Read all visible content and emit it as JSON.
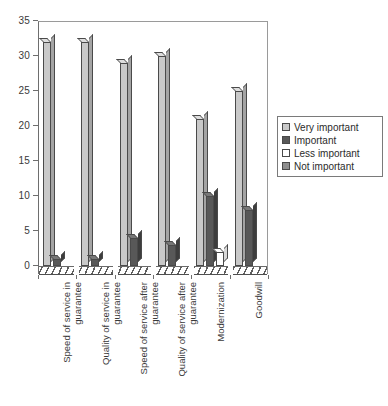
{
  "chart_data": {
    "type": "bar",
    "title": "",
    "subtitle": "",
    "xlabel": "",
    "ylabel": "",
    "ylim": [
      0,
      35
    ],
    "ytick_step": 5,
    "yticks": [
      0,
      5,
      10,
      15,
      20,
      25,
      30,
      35
    ],
    "grid": false,
    "legend_position": "right",
    "orientation": "vertical",
    "style": "3d-grouped-columns",
    "categories": [
      "Speed of service in guarantee",
      "Quality of service in guarantee",
      "Speed of service after guarantee",
      "Quality of service after guarantee",
      "Modernization",
      "Goodwill"
    ],
    "series": [
      {
        "name": "Very important",
        "color": "#c9c9c9",
        "values": [
          32,
          32,
          29,
          30,
          21,
          25
        ]
      },
      {
        "name": "Important",
        "color": "#585858",
        "values": [
          1,
          1,
          4,
          3,
          10,
          8
        ]
      },
      {
        "name": "Less important",
        "color": "#ffffff",
        "values": [
          0,
          0,
          0,
          0,
          2,
          0
        ]
      },
      {
        "name": "Not important",
        "color": "#8e8e8e",
        "values": [
          0,
          0,
          0,
          0,
          0,
          0
        ]
      }
    ]
  },
  "legend": {
    "items": [
      {
        "label": "Very important",
        "color": "#c9c9c9"
      },
      {
        "label": "Important",
        "color": "#585858"
      },
      {
        "label": "Less important",
        "color": "#ffffff"
      },
      {
        "label": "Not important",
        "color": "#8e8e8e"
      }
    ]
  },
  "axis": {
    "y_tick_labels": [
      "0",
      "5",
      "10",
      "15",
      "20",
      "25",
      "30",
      "35"
    ]
  }
}
